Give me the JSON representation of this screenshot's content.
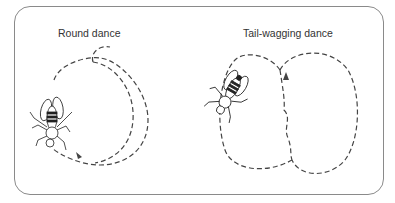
{
  "diagram": {
    "panels": [
      {
        "title": "Round dance",
        "path_style": "dashed",
        "has_bee": true
      },
      {
        "title": "Tail-wagging dance",
        "path_style": "dashed",
        "has_bee": true
      }
    ],
    "colors": {
      "border": "#8a8a8a",
      "line": "#444444",
      "text": "#333333"
    }
  }
}
